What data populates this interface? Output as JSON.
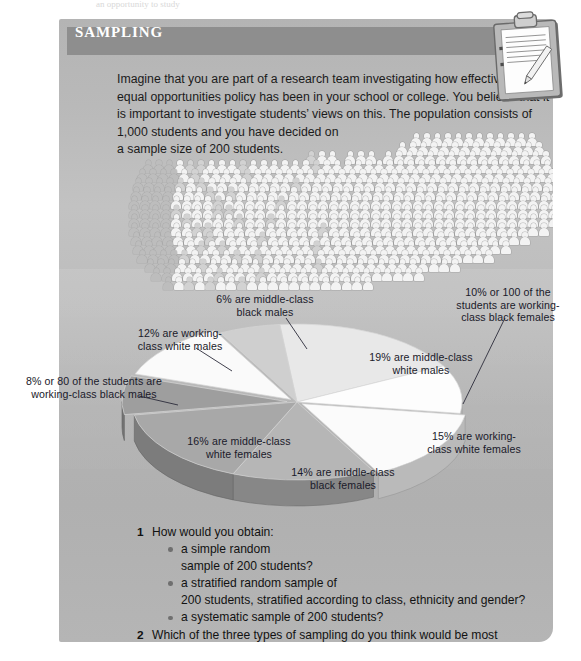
{
  "top_strip_text": "an opportunity to study",
  "panel": {
    "header_title": "SAMPLING",
    "intro_lines": [
      "Imagine that you are part of a research team investigating how effective the",
      "equal opportunities policy has been in your school or college. You believe that it",
      "is important to investigate students’ views on this. The population consists of",
      "1,000 students and you have decided on",
      "a sample size of 200 students."
    ]
  },
  "chart_data": {
    "type": "pie",
    "title": "",
    "units": "percent of 1,000 students",
    "total_population": 1000,
    "sample_size": 200,
    "categories": [
      "middle-class white males",
      "working-class black females",
      "working-class white females",
      "middle-class black females",
      "middle-class white females",
      "working-class black males",
      "working-class white males",
      "middle-class black males"
    ],
    "values": [
      19,
      10,
      15,
      14,
      16,
      8,
      12,
      6
    ],
    "labels": [
      "19% are middle-class\nwhite males",
      "10% or 100 of the\nstudents are working-\nclass black females",
      "15% are working-\nclass white females",
      "14% are middle-class\nblack females",
      "16% are middle-class\nwhite females",
      "8% or 80 of the students are\nworking-class black males",
      "12% are working-\nclass white males",
      "6% are middle-class\nblack males"
    ],
    "colors": [
      "#e8e8e8",
      "#fdfdfd",
      "#fbfbfb",
      "#b6b6b6",
      "#a8a8a8",
      "#9e9e9e",
      "#fafafa",
      "#cfcfcf"
    ],
    "legend": "none",
    "grid": false
  },
  "questions": [
    {
      "number": "1",
      "text": "How would you obtain:",
      "bullets": [
        [
          "a simple random",
          "sample of 200 students?"
        ],
        [
          "a stratified random sample of",
          "200 students, stratified according to class, ethnicity and gender?"
        ],
        [
          "a systematic sample of 200 students?"
        ]
      ]
    },
    {
      "number": "2",
      "text": "Which of the three types of sampling do you think would be most appropriate\nin order to obtain a representative sample? Explain your view.",
      "bullets": []
    }
  ],
  "illustration": {
    "name": "clipboard-with-pencil",
    "description": "clipboard holding a lined sheet of paper with a pencil resting on it"
  }
}
